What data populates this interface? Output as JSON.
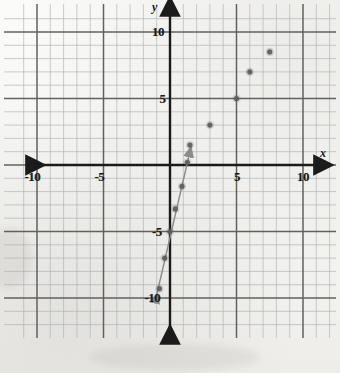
{
  "figure": {
    "kind": "hand-drawn-scatter-on-graph-paper",
    "paper_color": "#f4f4f2",
    "grid_minor_color": "#9aa0a6",
    "grid_major_color": "#4a4a4a",
    "axis_color": "#1b1b1b",
    "point_color": "#6b6b6b",
    "line_color": "#8c8c8c"
  },
  "axes": {
    "x_name": "x",
    "y_name": "y",
    "x_ticks": [
      {
        "value": -10,
        "label": "-10"
      },
      {
        "value": -5,
        "label": "-5"
      },
      {
        "value": 5,
        "label": "5"
      },
      {
        "value": 10,
        "label": "10"
      }
    ],
    "y_ticks": [
      {
        "value": 10,
        "label": "10"
      },
      {
        "value": 5,
        "label": "5"
      },
      {
        "value": -5,
        "label": "-5"
      },
      {
        "value": -10,
        "label": "-10"
      }
    ],
    "x_arrow_left": true,
    "x_arrow_right": true,
    "y_arrow_up": true,
    "y_arrow_down": true
  },
  "chart_data": {
    "type": "scatter",
    "title": "",
    "xlabel": "x",
    "ylabel": "y",
    "xlim": [
      -11.5,
      12.5
    ],
    "ylim": [
      -12,
      11.5
    ],
    "grid": true,
    "grid_minor_step": 1,
    "grid_major_step": 5,
    "legend": "none",
    "x": [
      -0.8,
      -0.4,
      0,
      0.4,
      0.9,
      1.3,
      1.5,
      3,
      5,
      6,
      7.5
    ],
    "y": [
      -9.3,
      -7,
      -5,
      -3.3,
      -1.6,
      0.2,
      1.5,
      3,
      5,
      7,
      8.5
    ],
    "points": [
      {
        "x": -0.8,
        "y": -9.3
      },
      {
        "x": -0.4,
        "y": -7.0
      },
      {
        "x": 0.0,
        "y": -5.0
      },
      {
        "x": 0.4,
        "y": -3.3
      },
      {
        "x": 0.9,
        "y": -1.6
      },
      {
        "x": 1.3,
        "y": 0.2
      },
      {
        "x": 1.5,
        "y": 1.5
      },
      {
        "x": 3.0,
        "y": 3.0
      },
      {
        "x": 5.0,
        "y": 5.0
      },
      {
        "x": 6.0,
        "y": 7.0
      },
      {
        "x": 7.5,
        "y": 8.5
      }
    ],
    "annotations": [
      {
        "type": "line-segment-with-arrowheads",
        "from": {
          "x": -1.1,
          "y": -10.2
        },
        "to": {
          "x": 1.45,
          "y": 0.8
        },
        "arrow_at_start": true,
        "arrow_at_end": true
      }
    ]
  }
}
